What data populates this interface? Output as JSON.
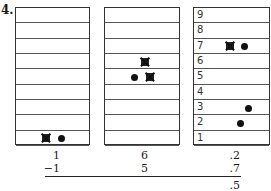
{
  "problem": {
    "number": "4."
  },
  "columns": [
    {
      "name": "ones",
      "row_labels": [],
      "counters": [
        {
          "row": 1,
          "type": "crossed-square"
        },
        {
          "row": 1,
          "type": "dot"
        }
      ],
      "top_value": "1",
      "subtract_value": "−1",
      "result": ""
    },
    {
      "name": "tenths-or-second",
      "row_labels": [],
      "counters": [
        {
          "row": 6,
          "type": "crossed-square"
        },
        {
          "row": 5,
          "type": "dot"
        },
        {
          "row": 5,
          "type": "crossed-square"
        }
      ],
      "top_value": "6",
      "subtract_value": "5",
      "result": ""
    },
    {
      "name": "decimal",
      "row_labels": [
        "9",
        "8",
        "7",
        "6",
        "5",
        "4",
        "3",
        "2",
        "1"
      ],
      "counters": [
        {
          "row": 7,
          "type": "crossed-square"
        },
        {
          "row": 7,
          "type": "dot"
        },
        {
          "row": 3,
          "type": "dot"
        },
        {
          "row": 2,
          "type": "dot"
        }
      ],
      "top_value": ".2",
      "subtract_value": ".7",
      "result": ".5"
    }
  ]
}
